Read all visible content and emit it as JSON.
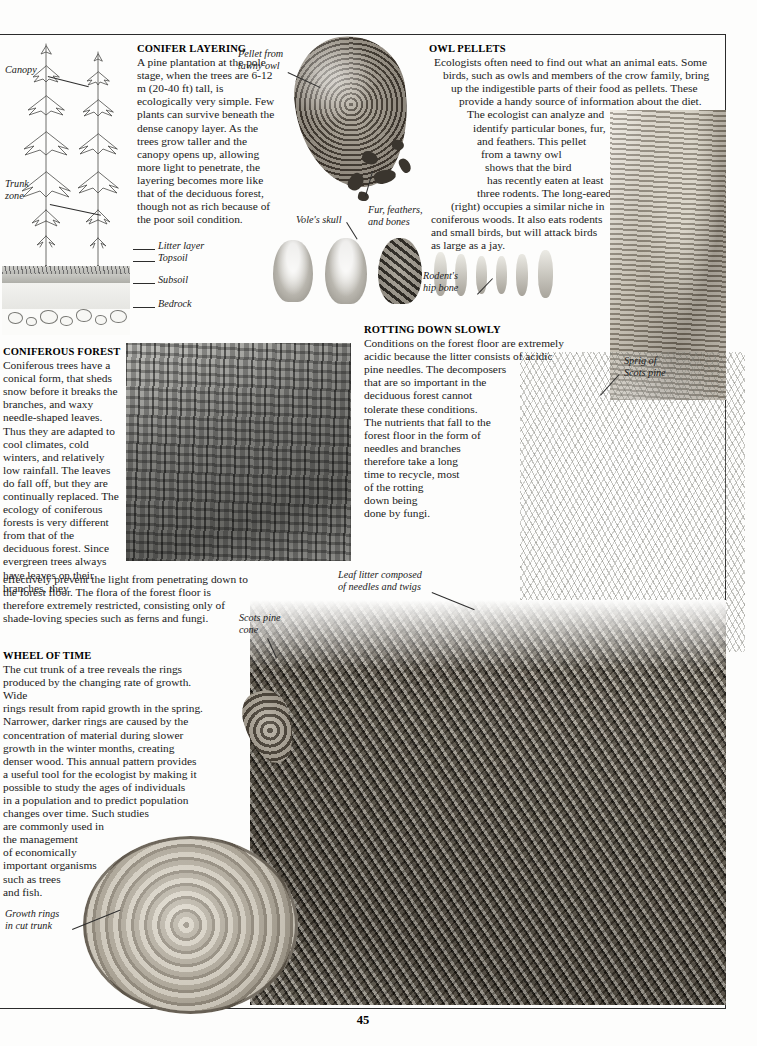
{
  "page": {
    "number": "45",
    "background_color": "#fdfdfc",
    "rule_color": "#2b2b2b"
  },
  "sections": [
    {
      "id": "conifer-layering",
      "heading": "CONIFER LAYERING",
      "body": "A pine plantation at the pole stage, when the trees are 6-12 m (20-40 ft) tall, is ecologically very simple. Few plants can survive beneath the dense canopy layer. As the trees grow taller and the canopy opens up, allowing more light to penetrate, the layering becomes more like that of the deciduous forest, though not as rich because of the poor soil condition."
    },
    {
      "id": "owl-pellets",
      "heading": "OWL PELLETS",
      "body": "Ecologists often need to find out what an animal eats. Some birds, such as owls and members of the crow family, bring up the indigestible parts of their food as pellets. These provide a handy source of information about the diet. The ecologist can analyze and identify particular bones, fur, and feathers. This pellet from a tawny owl shows that the bird has recently eaten at least three rodents. The long-eared owl (right) occupies a similar niche in coniferous woods. It also eats rodents and small birds, but will attack birds as large as a jay."
    },
    {
      "id": "coniferous-forest",
      "heading": "CONIFEROUS FOREST",
      "body_narrow": "Coniferous trees have a conical form, that sheds snow before it breaks the branches, and waxy needle-shaped leaves. Thus they are adapted to cool climates, cold winters, and relatively low rainfall. The leaves do fall off, but they are continually replaced. The ecology of coniferous forests is very different from that of the deciduous forest. Since evergreen trees always have leaves on their branches, they",
      "body_wide": "effectively prevent the light from penetrating down to the forest floor. The flora of the forest floor is therefore extremely restricted, consisting only of shade-loving species such as ferns and fungi."
    },
    {
      "id": "rotting-down-slowly",
      "heading": "ROTTING DOWN SLOWLY",
      "body": "Conditions on the forest floor are extremely acidic because the litter consists of acidic pine needles. The decomposers that are so important in the deciduous forest cannot tolerate these conditions. The nutrients that fall to the forest floor in the form of needles and branches therefore take a long time to recycle, most of the rotting down being done by fungi."
    },
    {
      "id": "wheel-of-time",
      "heading": "WHEEL OF TIME",
      "body": "The cut trunk of a tree reveals the rings produced by the changing rate of growth. Wide rings result from rapid growth in the spring. Narrower, darker rings are caused by the concentration of material during slower growth in the winter months, creating denser wood. This annual pattern provides a useful tool for the ecologist by making it possible to study the ages of individuals in a population and to predict population changes over time. Such studies are commonly used in the management of economically important organisms such as trees and fish."
    }
  ],
  "captions": {
    "canopy": "Canopy",
    "trunk_zone": "Trunk\nzone",
    "litter_layer": "Litter layer",
    "topsoil": "Topsoil",
    "subsoil": "Subsoil",
    "bedrock": "Bedrock",
    "pellet_from_tawny_owl": "Pellet from\ntawny owl",
    "voles_skull": "Vole's skull",
    "fur_feathers_and_bones": "Fur, feathers,\nand bones",
    "rodents_hip_bone": "Rodent's\nhip bone",
    "sprig_of_scots_pine": "Sprig of\nScots pine",
    "leaf_litter": "Leaf litter composed\nof needles and twigs",
    "scots_pine_cone": "Scots pine\ncone",
    "growth_rings": "Growth rings\nin cut trunk"
  },
  "images": [
    {
      "name": "conifer-layering-diagram",
      "alt": "Line drawing of two conifer trees with soil horizon layers"
    },
    {
      "name": "owl-pellet-photo",
      "alt": "Photograph of a tawny owl pellet with scattered debris"
    },
    {
      "name": "vole-skull-photo-1",
      "alt": "Rodent skull specimen"
    },
    {
      "name": "vole-skull-photo-2",
      "alt": "Rodent skull specimen"
    },
    {
      "name": "fur-feathers-bones-photo",
      "alt": "Clump of fur, feathers and bones"
    },
    {
      "name": "rodent-hip-bone-photo",
      "alt": "Row of small rodent hip bones"
    },
    {
      "name": "long-eared-owl-illustration",
      "alt": "Long-eared owl perched on a tree trunk"
    },
    {
      "name": "coniferous-forest-photo",
      "alt": "Photograph inside a dense coniferous forest"
    },
    {
      "name": "scots-pine-sprig-photo",
      "alt": "Sprig of Scots pine needles"
    },
    {
      "name": "leaf-litter-photo",
      "alt": "Forest floor leaf litter of needles, twigs and cones"
    },
    {
      "name": "scots-pine-cone-photo",
      "alt": "Scots pine cone"
    },
    {
      "name": "cut-trunk-photo",
      "alt": "Cross-section of a cut tree trunk showing growth rings"
    }
  ]
}
